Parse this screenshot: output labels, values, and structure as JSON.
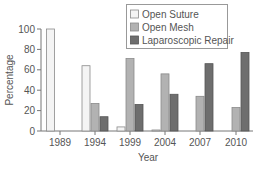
{
  "chart_data": {
    "type": "bar",
    "title": "",
    "xlabel": "Year",
    "ylabel": "Percentage",
    "ylim": [
      0,
      100
    ],
    "yticks": [
      0,
      20,
      40,
      60,
      80,
      100
    ],
    "grid": false,
    "legend_position": "top-right",
    "categories": [
      "1989",
      "1994",
      "1999",
      "2004",
      "2007",
      "2010"
    ],
    "series": [
      {
        "name": "Open Suture",
        "color": "#f4f4f4",
        "stroke": "#8a8a8a",
        "values": [
          100,
          64,
          4,
          1,
          0,
          0
        ]
      },
      {
        "name": "Open Mesh",
        "color": "#b2b2b2",
        "stroke": "#8a8a8a",
        "values": [
          0,
          27,
          71,
          56,
          34,
          23
        ]
      },
      {
        "name": "Laparoscopic Repair",
        "color": "#6e6e6e",
        "stroke": "#555555",
        "values": [
          0,
          14,
          26,
          36,
          66,
          77
        ]
      }
    ]
  }
}
